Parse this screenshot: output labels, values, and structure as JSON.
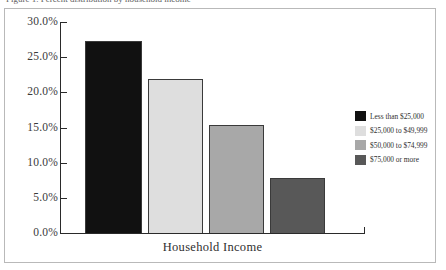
{
  "figure": {
    "caption_top": "Figure 1. Percent distribution by household income",
    "frame_border_color": "#b9b9b9",
    "background_color": "#ffffff"
  },
  "axes": {
    "y_tick_labels": [
      "30.0%",
      "25.0%",
      "20.0%",
      "15.0%",
      "10.0%",
      "5.0%",
      "0.0%"
    ],
    "x_axis_title": "Household Income",
    "axis_color": "#2a2a2a"
  },
  "legend": {
    "items": [
      {
        "label": "Less than $25,000",
        "color": "#111111"
      },
      {
        "label": "$25,000 to $49,999",
        "color": "#dedede"
      },
      {
        "label": "$50,000 to $74,999",
        "color": "#a8a8a8"
      },
      {
        "label": "$75,000 or more",
        "color": "#585858"
      }
    ]
  },
  "chart_data": {
    "type": "bar",
    "title": "",
    "xlabel": "Household Income",
    "ylabel": "",
    "categories": [
      "Less than $25,000",
      "$25,000 to $49,999",
      "$50,000 to $74,999",
      "$75,000 or more"
    ],
    "values": [
      27.3,
      21.9,
      15.3,
      7.8
    ],
    "value_labels": [
      "27.3%",
      "21.9%",
      "15.3%",
      "7.8%"
    ],
    "colors": [
      "#111111",
      "#dedede",
      "#a8a8a8",
      "#585858"
    ],
    "bar_edge_color": "#3a3a3a",
    "ylim": [
      0,
      30
    ],
    "ytick_values": [
      0,
      5,
      10,
      15,
      20,
      25,
      30
    ],
    "ytick_labels": [
      "0.0%",
      "5.0%",
      "10.0%",
      "15.0%",
      "20.0%",
      "25.0%",
      "30.0%"
    ],
    "grid": false,
    "legend_position": "right"
  }
}
